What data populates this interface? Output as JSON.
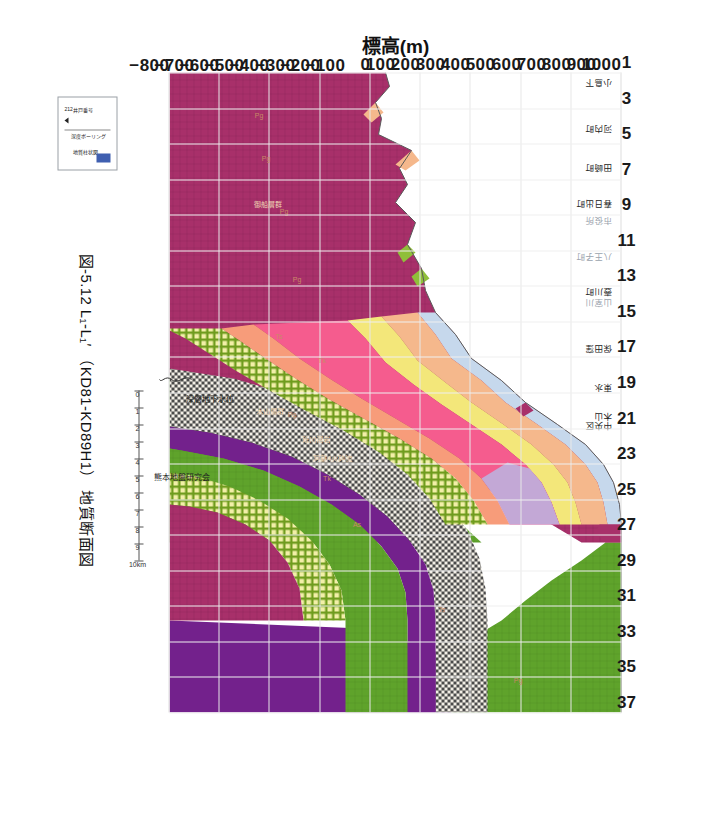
{
  "figure": {
    "caption": "図-5.12  L₁-L₁′ （KD81-KD89H1） 地質断面図",
    "credit": "熊本地盤研究会"
  },
  "axes": {
    "y_title": "標高(m)",
    "y_ticks": [
      "1000",
      "900",
      "800",
      "700",
      "600",
      "500",
      "400",
      "300",
      "200",
      "100",
      "0",
      "-100",
      "-200",
      "-300",
      "-400",
      "-500",
      "-600",
      "-700",
      "-800"
    ],
    "y_min": -800,
    "y_max": 1000,
    "x_ticks": [
      "1",
      "3",
      "5",
      "7",
      "9",
      "11",
      "13",
      "15",
      "17",
      "19",
      "21",
      "23",
      "25",
      "27",
      "29",
      "31",
      "33",
      "35",
      "37"
    ],
    "x_min": 1,
    "x_max": 37
  },
  "scalebar": {
    "ticks": [
      "0",
      "1",
      "2",
      "3",
      "4",
      "5",
      "6",
      "7",
      "8",
      "9",
      "10km"
    ]
  },
  "annotations": {
    "groundwater": "深層地下水位"
  },
  "legend": {
    "well_number": "212",
    "well_number_label": "井戸番号",
    "depth_label": "深度ボーリング",
    "column_label": "地質柱状図"
  },
  "places": [
    {
      "name": "小島下",
      "x": 1.6,
      "faint": false
    },
    {
      "name": "河内町",
      "x": 4.2,
      "faint": false
    },
    {
      "name": "田崎町",
      "x": 6.4,
      "faint": false
    },
    {
      "name": "春日出町",
      "x": 8.4,
      "faint": false
    },
    {
      "name": "市役所",
      "x": 9.4,
      "faint": true
    },
    {
      "name": "八王子町",
      "x": 11.4,
      "faint": true
    },
    {
      "name": "壺川町",
      "x": 13.4,
      "faint": false
    },
    {
      "name": "山室川",
      "x": 14.0,
      "faint": true
    },
    {
      "name": "保田窪",
      "x": 16.6,
      "faint": false
    },
    {
      "name": "東水",
      "x": 18.8,
      "faint": false
    },
    {
      "name": "木山",
      "x": 20.4,
      "faint": false
    },
    {
      "name": "中央区",
      "x": 20.9,
      "faint": false
    }
  ],
  "unit_labels": [
    {
      "text": "Pg",
      "x": 35.0,
      "y": 600
    },
    {
      "text": "Ts",
      "x": 31.0,
      "y": 300
    },
    {
      "text": "As",
      "x": 26.2,
      "y": -40
    },
    {
      "text": "Tk",
      "x": 23.6,
      "y": -160
    },
    {
      "text": "Pg",
      "x": 20.0,
      "y": -300
    },
    {
      "text": "Tk",
      "x": 17.0,
      "y": -180
    },
    {
      "text": "Ts",
      "x": 15.6,
      "y": -350
    },
    {
      "text": "Pg",
      "x": 12.4,
      "y": -280
    },
    {
      "text": "Pg",
      "x": 8.6,
      "y": -330
    },
    {
      "text": "Pg",
      "x": 5.6,
      "y": -400
    },
    {
      "text": "Pg",
      "x": 3.2,
      "y": -430
    }
  ],
  "unit_labels_dark": [
    {
      "text": "阿蘇4火砕流",
      "x": 21.6,
      "y": -130
    },
    {
      "text": "砥川溶岩",
      "x": 20.8,
      "y": -200
    },
    {
      "text": "木山層群",
      "x": 19.2,
      "y": -380
    },
    {
      "text": "御船層群",
      "x": 7.6,
      "y": -390
    }
  ],
  "colors": {
    "crimson": "#A8306A",
    "green": "#5FA32B",
    "purple": "#73218C",
    "pink": "#F55C8E",
    "peach": "#F5B88C",
    "salmon": "#F79C7A",
    "yellow": "#F3E77A",
    "olive_check": "#9FB83A",
    "lavender": "#C3A8D6",
    "lightblue": "#C6D8EC",
    "grid": "#E7E7E7"
  }
}
